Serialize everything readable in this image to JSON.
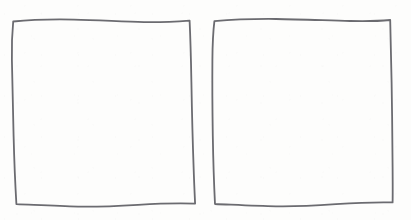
{
  "canvas": {
    "width": 411,
    "height": 220,
    "background_color": "#fdfdfc",
    "description": "Two hand-drawn squares side by side"
  },
  "style": {
    "stroke_color": "#6b6b70",
    "stroke_width": 1.8,
    "fill": "none"
  },
  "shapes": [
    {
      "name": "square-left",
      "type": "square",
      "label": "Left hand-drawn square",
      "bounds": {
        "x": 12,
        "y": 20,
        "width": 183,
        "height": 186
      },
      "path": "M 13.2 21.5 C 30 19.8, 52 19.2, 74 19.6 C 98 20.1, 122 21.6, 144 22.1 C 160 22.4, 176 21.6, 189.6 20.6 C 190.4 38, 191.0 60, 191.4 82 C 191.9 110, 192.6 140, 193.6 167 C 194.0 180, 194.6 193, 195.1 203.6 C 178 203.0, 158 203.6, 138 204.8 C 118 206.0, 98 207.0, 78 206.6 C 58 206.2, 36 205.0, 16.4 204.2 C 15.2 184, 14.2 160, 13.6 136 C 13.0 110, 12.4 84, 11.9 60 C 11.6 46, 12.2 32, 13.2 21.5 Z"
    },
    {
      "name": "square-right",
      "type": "square",
      "label": "Right hand-drawn square",
      "bounds": {
        "x": 212,
        "y": 19,
        "width": 181,
        "height": 187
      },
      "path": "M 214.4 21.2 C 232 19.6, 254 18.8, 276 19.0 C 300 19.3, 326 20.4, 350 21.0 C 366 21.4, 380 21.0, 390.2 20.0 C 390.8 38, 391.2 60, 391.6 82 C 392.1 110, 392.4 140, 392.6 167 C 392.7 180, 392.8 193, 392.6 202.4 C 376 202.0, 356 202.8, 336 204.2 C 316 205.6, 296 206.8, 276 206.4 C 256 206.0, 234 204.8, 215.0 204.0 C 214.0 184, 213.2 160, 212.8 136 C 212.4 110, 212.2 84, 212.4 60 C 212.5 46, 213.2 31, 214.4 21.2 Z"
    }
  ]
}
